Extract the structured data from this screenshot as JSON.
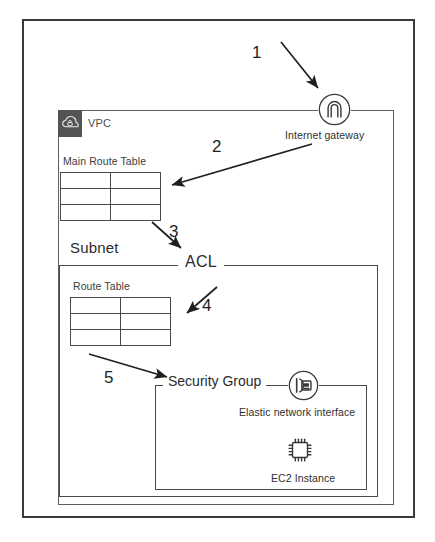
{
  "diagram": {
    "outer_container": {
      "name": "AWS Region boundary"
    },
    "vpc": {
      "label": "VPC",
      "icon": "cloud-lock-icon",
      "tab_color": "#545454"
    },
    "internet_gateway": {
      "caption": "Internet gateway",
      "icon": "internet-gateway-icon"
    },
    "main_route_table": {
      "title": "Main Route Table",
      "rows": 3,
      "cols": 2
    },
    "subnet": {
      "label": "Subnet"
    },
    "acl": {
      "label": "ACL"
    },
    "subnet_route_table": {
      "title": "Route  Table",
      "rows": 3,
      "cols": 2
    },
    "security_group": {
      "label": "Security Group"
    },
    "elastic_network_interface": {
      "caption": "Elastic network interface",
      "icon": "elastic-network-interface-icon"
    },
    "ec2_instance": {
      "caption": "EC2 Instance",
      "icon": "ec2-chip-icon"
    },
    "steps": [
      {
        "number": "1",
        "from": "Internet",
        "to": "Internet gateway"
      },
      {
        "number": "2",
        "from": "Internet gateway",
        "to": "Main Route Table"
      },
      {
        "number": "3",
        "from": "Main Route Table",
        "to": "ACL"
      },
      {
        "number": "4",
        "from": "ACL",
        "to": "Route Table"
      },
      {
        "number": "5",
        "from": "Route Table",
        "to": "Security Group"
      }
    ],
    "colors": {
      "line": "#3a3a3a",
      "vpc_tab": "#545454",
      "text": "#2b2b2b",
      "background": "#ffffff"
    }
  }
}
